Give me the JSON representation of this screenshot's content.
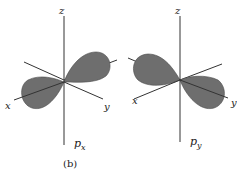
{
  "figure": {
    "caption": "(b)",
    "colors": {
      "lobe": "#6e6e6e",
      "lobe_edge": "#4a4a4a",
      "axis": "#333333",
      "background": "#ffffff"
    },
    "panels": [
      {
        "name": "px",
        "orbital_label": "p",
        "orbital_subscript": "x",
        "axes": {
          "z": "z",
          "x": "x",
          "y": "y"
        }
      },
      {
        "name": "py",
        "orbital_label": "p",
        "orbital_subscript": "y",
        "axes": {
          "z": "z",
          "x": "x",
          "y": "y"
        }
      }
    ]
  }
}
